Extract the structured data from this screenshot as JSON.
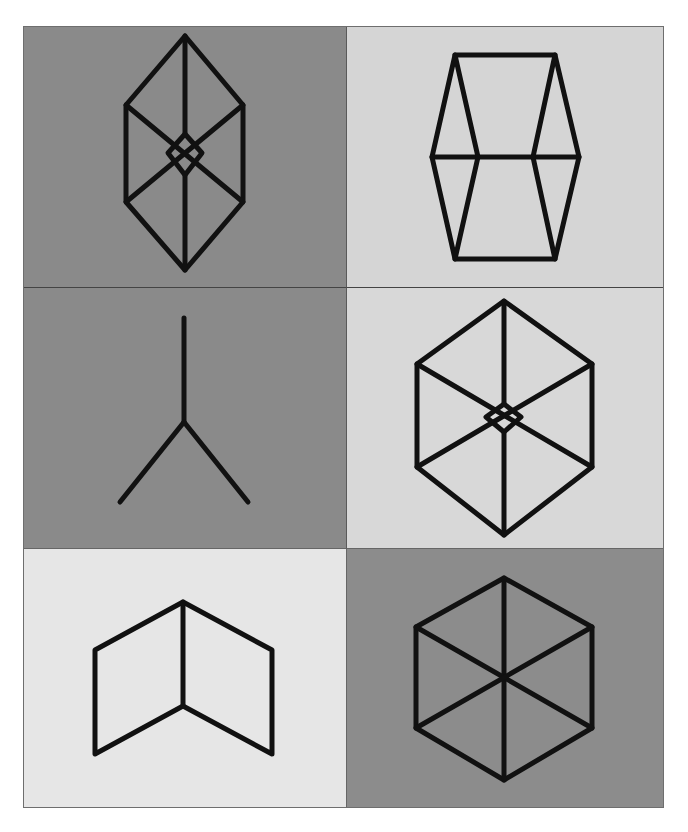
{
  "title": "",
  "grid": {
    "rows": 3,
    "cols": 2,
    "cells": [
      {
        "id": "r1c1",
        "label": "sliced hexagonal prism with inner square",
        "bg": "#8a8a8a"
      },
      {
        "id": "r1c2",
        "label": "hexagonal prism frame",
        "bg": "#d5d5d5"
      },
      {
        "id": "r2c1",
        "label": "Y-junction lines",
        "bg": "#8a8a8a"
      },
      {
        "id": "r2c2",
        "label": "hexagon with inner square",
        "bg": "#d8d8d8"
      },
      {
        "id": "r3c1",
        "label": "open book / two parallelograms",
        "bg": "#e6e6e6"
      },
      {
        "id": "r3c2",
        "label": "hexagon with three diagonals",
        "bg": "#8c8c8c"
      }
    ]
  },
  "colors": {
    "stroke": "#111111",
    "border": "#6e6e6e"
  }
}
